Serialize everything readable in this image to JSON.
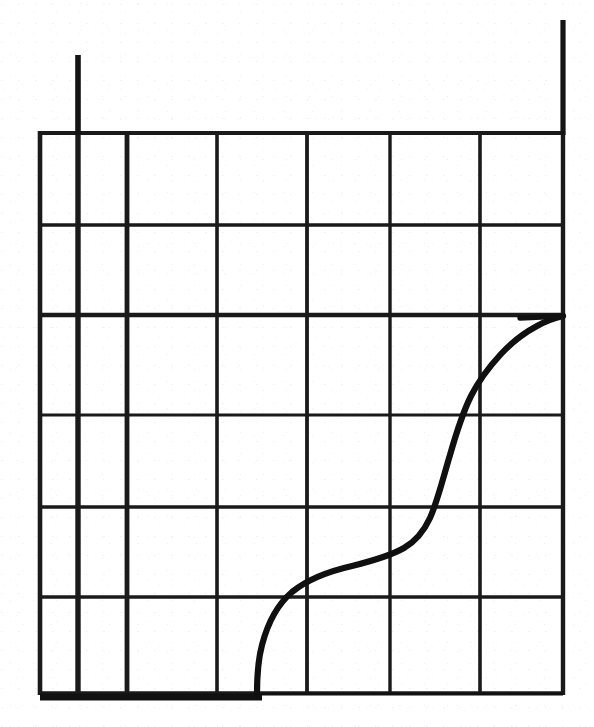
{
  "figure": {
    "title": "",
    "caption": "",
    "background_color": "#ffffff",
    "ink_color": "#151515"
  },
  "chart_data": {
    "type": "line",
    "title": "",
    "subtitle": "",
    "xlabel": "",
    "ylabel": "",
    "xlim": [
      0,
      7
    ],
    "ylim": [
      0,
      6
    ],
    "grid": true,
    "legend": null,
    "legend_position": "none",
    "x_tick_labels": [],
    "y_tick_labels": [],
    "annotations": [],
    "series": [
      {
        "name": "curve",
        "style": "solid",
        "color": "#151515",
        "width_px": 5,
        "x": [
          2.46,
          2.5,
          2.56,
          2.66,
          2.84,
          3.1,
          3.45,
          3.9,
          4.3,
          4.62,
          4.86,
          5.05,
          5.26,
          5.55,
          5.95,
          6.4,
          7.0
        ],
        "y": [
          0.0,
          0.22,
          0.45,
          0.7,
          0.92,
          1.06,
          1.18,
          1.32,
          1.55,
          1.92,
          2.35,
          2.72,
          3.02,
          3.22,
          3.34,
          3.4,
          3.42
        ]
      }
    ],
    "grid_lines": {
      "vertical_x": [
        0,
        0.42,
        1.0,
        2.0,
        3.0,
        3.92,
        4.92,
        5.82
      ],
      "horizontal_y": [
        0,
        0.96,
        1.84,
        2.84,
        3.84,
        4.69,
        5.59
      ]
    },
    "emphasis": {
      "heavy_vertical_x": [
        0,
        0.42,
        1.0
      ],
      "heavy_horizontal_y": [
        3.42
      ],
      "extended_verticals": [
        {
          "x": 0.42,
          "note": "extends above plot area"
        },
        {
          "x": 5.82,
          "note": "extends above plot area"
        }
      ]
    }
  },
  "geometry": {
    "plot_left_px": 40,
    "plot_right_px": 563,
    "plot_top_px": 133,
    "plot_bottom_px": 693,
    "columns_px": [
      40,
      78,
      127,
      217,
      307,
      390,
      480,
      563
    ],
    "rows_px": [
      133,
      225,
      315,
      415,
      507,
      597,
      693
    ],
    "left_post_px": {
      "x": 78,
      "top": 55,
      "bottom": 133
    },
    "right_post_px": {
      "x": 563,
      "top": 20,
      "bottom": 133
    },
    "curve_path": "M 257,694 C 257,676 258,660 262,645 C 268,622 278,604 292,592 C 308,579 330,571 352,566 C 372,561 390,556 404,548 C 416,541 424,531 430,518 C 438,500 443,478 450,455 C 456,434 462,414 471,396 C 479,380 489,367 501,354 C 512,342 524,333 537,326 C 546,321 554,318 563,316"
  }
}
